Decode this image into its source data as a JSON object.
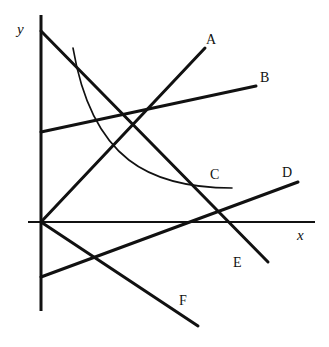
{
  "figure": {
    "background_color": "#ffffff",
    "stroke_color": "#111111",
    "width": 329,
    "height": 347
  },
  "axes": {
    "x_label": "x",
    "y_label": "y",
    "origin": {
      "x": 41,
      "y": 222
    },
    "x_axis": {
      "x1": 28,
      "y1": 222,
      "x2": 315,
      "y2": 222,
      "stroke_width": 2
    },
    "y_axis": {
      "x1": 41,
      "y1": 15,
      "x2": 41,
      "y2": 311,
      "stroke_width": 3
    },
    "x_label_pos": {
      "x": 297,
      "y": 228
    },
    "y_label_pos": {
      "x": 17,
      "y": 22
    }
  },
  "chart_data": {
    "type": "line",
    "title": "",
    "xlabel": "x",
    "ylabel": "y",
    "grid": false,
    "legend": "inline-end-labels",
    "series": [
      {
        "name": "A",
        "shape": "line",
        "label": "A",
        "label_pos": {
          "x": 206,
          "y": 33
        },
        "stroke_width": 3,
        "points": [
          {
            "x": 41,
            "y": 222
          },
          {
            "x": 205,
            "y": 48
          }
        ],
        "slope_sign": "positive",
        "note": "steep rising line through the origin"
      },
      {
        "name": "B",
        "shape": "line",
        "label": "B",
        "label_pos": {
          "x": 260,
          "y": 71
        },
        "stroke_width": 3,
        "points": [
          {
            "x": 41,
            "y": 132
          },
          {
            "x": 256,
            "y": 86
          }
        ],
        "slope_sign": "positive",
        "note": "gently rising line with positive y-intercept"
      },
      {
        "name": "C",
        "shape": "curve",
        "label": "C",
        "label_pos": {
          "x": 210,
          "y": 168
        },
        "stroke_width": 1.6,
        "points": [
          {
            "x": 73,
            "y": 48
          },
          {
            "x": 232,
            "y": 188
          }
        ],
        "control_points": [
          {
            "x": 92,
            "y": 160
          },
          {
            "x": 150,
            "y": 188
          }
        ],
        "slope_sign": "negative",
        "note": "thin convex decreasing curve, asymptotically flattening"
      },
      {
        "name": "D",
        "shape": "line",
        "label": "D",
        "label_pos": {
          "x": 282,
          "y": 166
        },
        "stroke_width": 3,
        "points": [
          {
            "x": 41,
            "y": 277
          },
          {
            "x": 298,
            "y": 182
          }
        ],
        "slope_sign": "positive",
        "note": "gently rising line with negative y-intercept"
      },
      {
        "name": "E",
        "shape": "line",
        "label": "E",
        "label_pos": {
          "x": 233,
          "y": 256
        },
        "stroke_width": 3,
        "points": [
          {
            "x": 41,
            "y": 31
          },
          {
            "x": 268,
            "y": 262
          }
        ],
        "slope_sign": "negative",
        "note": "steep falling line with large positive y-intercept"
      },
      {
        "name": "F",
        "shape": "line",
        "label": "F",
        "label_pos": {
          "x": 179,
          "y": 294
        },
        "stroke_width": 3,
        "points": [
          {
            "x": 41,
            "y": 222
          },
          {
            "x": 198,
            "y": 326
          }
        ],
        "slope_sign": "negative",
        "note": "falling line through the origin"
      }
    ]
  }
}
